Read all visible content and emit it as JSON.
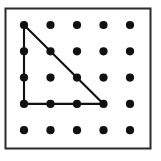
{
  "figure": {
    "kind": "geoboard-dot-grid",
    "canvas": {
      "width": 161,
      "height": 161,
      "background": "#ffffff"
    },
    "frame": {
      "name": "board-frame",
      "x": 5.5,
      "y": 8.5,
      "width": 145,
      "height": 140,
      "stroke": "#2b2b2b",
      "stroke_width": 2,
      "fill": "#fefefe"
    },
    "grid": {
      "columns": 5,
      "rows": 5,
      "origin_x": 24,
      "origin_y": 25,
      "spacing_x": 26.5,
      "spacing_y": 26.3,
      "dot_radius": 4.1,
      "dot_color": "#111111",
      "total_dots": 25
    },
    "dots": [
      {
        "col": 0,
        "row": 0,
        "cx": 24.0,
        "cy": 25.0,
        "on_shape": true
      },
      {
        "col": 1,
        "row": 0,
        "cx": 50.5,
        "cy": 25.0,
        "on_shape": false
      },
      {
        "col": 2,
        "row": 0,
        "cx": 77.0,
        "cy": 25.0,
        "on_shape": false
      },
      {
        "col": 3,
        "row": 0,
        "cx": 103.5,
        "cy": 25.0,
        "on_shape": false
      },
      {
        "col": 4,
        "row": 0,
        "cx": 130.0,
        "cy": 25.0,
        "on_shape": false
      },
      {
        "col": 0,
        "row": 1,
        "cx": 24.0,
        "cy": 51.3,
        "on_shape": true
      },
      {
        "col": 1,
        "row": 1,
        "cx": 50.5,
        "cy": 51.3,
        "on_shape": true
      },
      {
        "col": 2,
        "row": 1,
        "cx": 77.0,
        "cy": 51.3,
        "on_shape": false
      },
      {
        "col": 3,
        "row": 1,
        "cx": 103.5,
        "cy": 51.3,
        "on_shape": false
      },
      {
        "col": 4,
        "row": 1,
        "cx": 130.0,
        "cy": 51.3,
        "on_shape": false
      },
      {
        "col": 0,
        "row": 2,
        "cx": 24.0,
        "cy": 77.6,
        "on_shape": true
      },
      {
        "col": 1,
        "row": 2,
        "cx": 50.5,
        "cy": 77.6,
        "on_shape": false
      },
      {
        "col": 2,
        "row": 2,
        "cx": 77.0,
        "cy": 77.6,
        "on_shape": true
      },
      {
        "col": 3,
        "row": 2,
        "cx": 103.5,
        "cy": 77.6,
        "on_shape": false
      },
      {
        "col": 4,
        "row": 2,
        "cx": 130.0,
        "cy": 77.6,
        "on_shape": false
      },
      {
        "col": 0,
        "row": 3,
        "cx": 24.0,
        "cy": 103.9,
        "on_shape": true
      },
      {
        "col": 1,
        "row": 3,
        "cx": 50.5,
        "cy": 103.9,
        "on_shape": true
      },
      {
        "col": 2,
        "row": 3,
        "cx": 77.0,
        "cy": 103.9,
        "on_shape": true
      },
      {
        "col": 3,
        "row": 3,
        "cx": 103.5,
        "cy": 103.9,
        "on_shape": true
      },
      {
        "col": 4,
        "row": 3,
        "cx": 130.0,
        "cy": 103.9,
        "on_shape": false
      },
      {
        "col": 0,
        "row": 4,
        "cx": 24.0,
        "cy": 130.2,
        "on_shape": false
      },
      {
        "col": 1,
        "row": 4,
        "cx": 50.5,
        "cy": 130.2,
        "on_shape": false
      },
      {
        "col": 2,
        "row": 4,
        "cx": 77.0,
        "cy": 130.2,
        "on_shape": false
      },
      {
        "col": 3,
        "row": 4,
        "cx": 103.5,
        "cy": 130.2,
        "on_shape": false
      },
      {
        "col": 4,
        "row": 4,
        "cx": 130.0,
        "cy": 130.2,
        "on_shape": false
      }
    ],
    "shape": {
      "name": "right-triangle",
      "type": "polygon",
      "closed": true,
      "stroke": "#111111",
      "stroke_width": 2.1,
      "fill": "none",
      "vertices_grid": [
        {
          "col": 0,
          "row": 0
        },
        {
          "col": 0,
          "row": 3
        },
        {
          "col": 3,
          "row": 3
        }
      ],
      "points": "24,25 24,103.9 103.5,103.9",
      "legs": {
        "vertical_units": 3,
        "horizontal_units": 3,
        "right_angle_at_grid": {
          "col": 0,
          "row": 3
        }
      }
    },
    "labels": {
      "alt_text": "A five by five array of dots forming a geoboard, enclosed in a thin rectangular frame. A right triangle is drawn on the dots with its right angle at the lower left, a vertical leg three units tall, a horizontal leg three units wide, and a hypotenuse from the top left dot down to the lower right vertex."
    }
  }
}
